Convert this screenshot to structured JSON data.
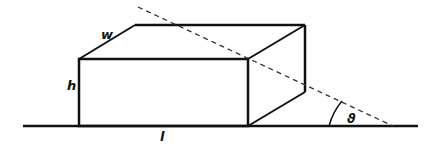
{
  "diagram": {
    "labels": {
      "width": "w",
      "height": "h",
      "length": "l",
      "angle": "ϑ"
    },
    "colors": {
      "stroke": "#111111",
      "background": "#ffffff"
    }
  }
}
